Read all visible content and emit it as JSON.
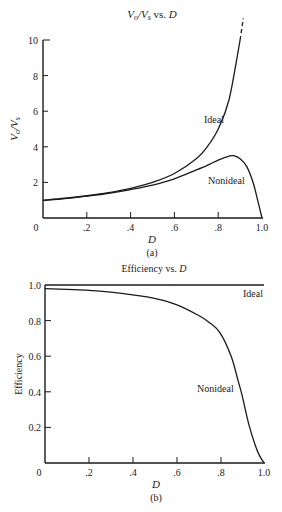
{
  "chart_data": [
    {
      "type": "line",
      "panel_label": "(a)",
      "title": "Vo/Vs vs. D",
      "title_parts": {
        "v1": "V",
        "s1": "o",
        "slash": "/",
        "v2": "V",
        "s2": "s",
        "rest": " vs. ",
        "d": "D"
      },
      "xlabel": "D",
      "ylabel": "Vo/Vs",
      "ylabel_parts": {
        "v1": "V",
        "s1": "o",
        "slash": "/",
        "v2": "V",
        "s2": "s"
      },
      "xlim": [
        0,
        1.0
      ],
      "ylim": [
        0,
        10
      ],
      "x_ticks": [
        "0",
        ".2",
        ".4",
        ".6",
        ".8",
        "1.0"
      ],
      "y_ticks": [
        "2",
        "4",
        "6",
        "8",
        "10"
      ],
      "grid": false,
      "series": [
        {
          "name": "Ideal",
          "x": [
            0,
            0.1,
            0.2,
            0.3,
            0.4,
            0.5,
            0.6,
            0.7,
            0.75,
            0.8,
            0.85,
            0.9
          ],
          "values": [
            1.0,
            1.11,
            1.25,
            1.43,
            1.67,
            2.0,
            2.5,
            3.33,
            4.0,
            5.0,
            6.67,
            10.0
          ],
          "extension_dashed": {
            "x": [
              0.9,
              0.91
            ],
            "values": [
              10.0,
              11.1
            ]
          }
        },
        {
          "name": "Nonideal",
          "x": [
            0,
            0.1,
            0.2,
            0.3,
            0.4,
            0.5,
            0.6,
            0.7,
            0.75,
            0.8,
            0.85,
            0.87,
            0.9,
            0.93,
            0.96,
            0.98,
            1.0
          ],
          "values": [
            0.98,
            1.09,
            1.23,
            1.39,
            1.6,
            1.85,
            2.2,
            2.7,
            2.96,
            3.25,
            3.48,
            3.5,
            3.33,
            2.9,
            1.97,
            1.0,
            0.0
          ]
        }
      ],
      "annotations": [
        {
          "text": "Ideal",
          "x": 0.8,
          "y": 5.8
        },
        {
          "text": "Nonideal",
          "x": 0.84,
          "y": 2.0
        }
      ]
    },
    {
      "type": "line",
      "panel_label": "(b)",
      "title": "Efficiency vs. D",
      "title_parts": {
        "text": "Efficiency vs. ",
        "d": "D"
      },
      "xlabel": "D",
      "ylabel": "Efficiency",
      "xlim": [
        0,
        1.0
      ],
      "ylim": [
        0,
        1.0
      ],
      "x_ticks": [
        "0",
        ".2",
        ".4",
        ".6",
        ".8",
        "1.0"
      ],
      "y_ticks": [
        "0.2",
        "0.4",
        "0.6",
        "0.8",
        "1.0"
      ],
      "grid": false,
      "series": [
        {
          "name": "Ideal",
          "x": [
            0,
            1.0
          ],
          "values": [
            1.0,
            1.0
          ]
        },
        {
          "name": "Nonideal",
          "x": [
            0,
            0.1,
            0.2,
            0.3,
            0.4,
            0.5,
            0.6,
            0.7,
            0.75,
            0.8,
            0.85,
            0.88,
            0.9,
            0.93,
            0.96,
            0.98,
            1.0
          ],
          "values": [
            0.98,
            0.975,
            0.97,
            0.96,
            0.945,
            0.925,
            0.89,
            0.83,
            0.79,
            0.73,
            0.6,
            0.47,
            0.38,
            0.22,
            0.1,
            0.04,
            0.0
          ]
        }
      ],
      "annotations": [
        {
          "text": "Ideal",
          "x": 0.95,
          "y": 0.94
        },
        {
          "text": "Nonideal",
          "x": 0.8,
          "y": 0.45
        }
      ]
    }
  ]
}
